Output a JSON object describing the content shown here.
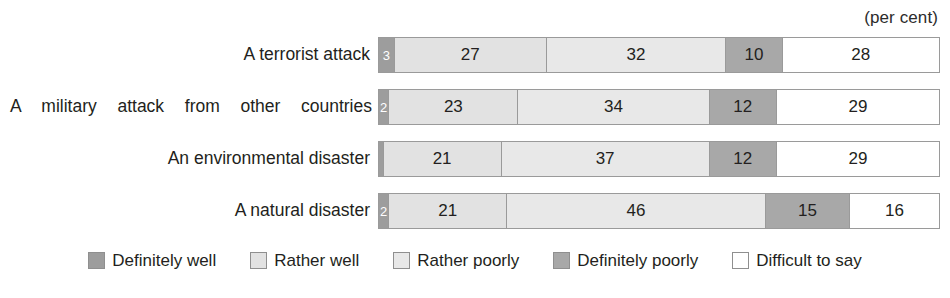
{
  "unit_caption": "(per cent)",
  "chart_data": {
    "type": "bar",
    "orientation": "horizontal",
    "stacked": true,
    "normalized_percent": true,
    "title": "",
    "subtitle": "",
    "xlabel": "",
    "ylabel": "",
    "unit_note": "(per cent)",
    "xlim": [
      0,
      100
    ],
    "grid": false,
    "legend_position": "bottom",
    "categories": [
      "A terrorist attack",
      "A military attack from other countries",
      "An environmental disaster",
      "A natural disaster"
    ],
    "series": [
      {
        "name": "Definitely well",
        "color": "#9d9d9d",
        "values": [
          3,
          2,
          1,
          2
        ]
      },
      {
        "name": "Rather well",
        "color": "#e2e2e2",
        "values": [
          27,
          23,
          21,
          21
        ]
      },
      {
        "name": "Rather poorly",
        "color": "#e8e8e8",
        "values": [
          32,
          34,
          37,
          46
        ]
      },
      {
        "name": "Definitely poorly",
        "color": "#a8a8a8",
        "values": [
          10,
          12,
          12,
          15
        ]
      },
      {
        "name": "Difficult to say",
        "color": "#ffffff",
        "values": [
          28,
          29,
          29,
          16
        ]
      }
    ]
  },
  "rows": [
    {
      "label": "A terrorist attack",
      "justified": false,
      "segments": [
        {
          "series": "Definitely well",
          "value": 3,
          "display": "3",
          "width_pct": 3
        },
        {
          "series": "Rather well",
          "value": 27,
          "display": "27",
          "width_pct": 27
        },
        {
          "series": "Rather poorly",
          "value": 32,
          "display": "32",
          "width_pct": 32
        },
        {
          "series": "Definitely poorly",
          "value": 10,
          "display": "10",
          "width_pct": 10
        },
        {
          "series": "Difficult to say",
          "value": 28,
          "display": "28",
          "width_pct": 28
        }
      ]
    },
    {
      "label": "A military attack from other countries",
      "justified": true,
      "segments": [
        {
          "series": "Definitely well",
          "value": 2,
          "display": "2",
          "width_pct": 2
        },
        {
          "series": "Rather well",
          "value": 23,
          "display": "23",
          "width_pct": 23
        },
        {
          "series": "Rather poorly",
          "value": 34,
          "display": "34",
          "width_pct": 34
        },
        {
          "series": "Definitely poorly",
          "value": 12,
          "display": "12",
          "width_pct": 12
        },
        {
          "series": "Difficult to say",
          "value": 29,
          "display": "29",
          "width_pct": 29
        }
      ]
    },
    {
      "label": "An environmental disaster",
      "justified": false,
      "segments": [
        {
          "series": "Definitely well",
          "value": 1,
          "display": "",
          "width_pct": 1
        },
        {
          "series": "Rather well",
          "value": 21,
          "display": "21",
          "width_pct": 21
        },
        {
          "series": "Rather poorly",
          "value": 37,
          "display": "37",
          "width_pct": 37
        },
        {
          "series": "Definitely poorly",
          "value": 12,
          "display": "12",
          "width_pct": 12
        },
        {
          "series": "Difficult to say",
          "value": 29,
          "display": "29",
          "width_pct": 29
        }
      ]
    },
    {
      "label": "A natural disaster",
      "justified": false,
      "segments": [
        {
          "series": "Definitely well",
          "value": 2,
          "display": "2",
          "width_pct": 2
        },
        {
          "series": "Rather well",
          "value": 21,
          "display": "21",
          "width_pct": 21
        },
        {
          "series": "Rather poorly",
          "value": 46,
          "display": "46",
          "width_pct": 46
        },
        {
          "series": "Definitely poorly",
          "value": 15,
          "display": "15",
          "width_pct": 15
        },
        {
          "series": "Difficult to say",
          "value": 16,
          "display": "16",
          "width_pct": 16
        }
      ]
    }
  ],
  "legend": {
    "items": [
      {
        "label": "Definitely well",
        "color": "#9d9d9d"
      },
      {
        "label": "Rather well",
        "color": "#e2e2e2"
      },
      {
        "label": "Rather poorly",
        "color": "#e8e8e8"
      },
      {
        "label": "Definitely poorly",
        "color": "#a8a8a8"
      },
      {
        "label": "Difficult to say",
        "color": "#ffffff"
      }
    ]
  }
}
